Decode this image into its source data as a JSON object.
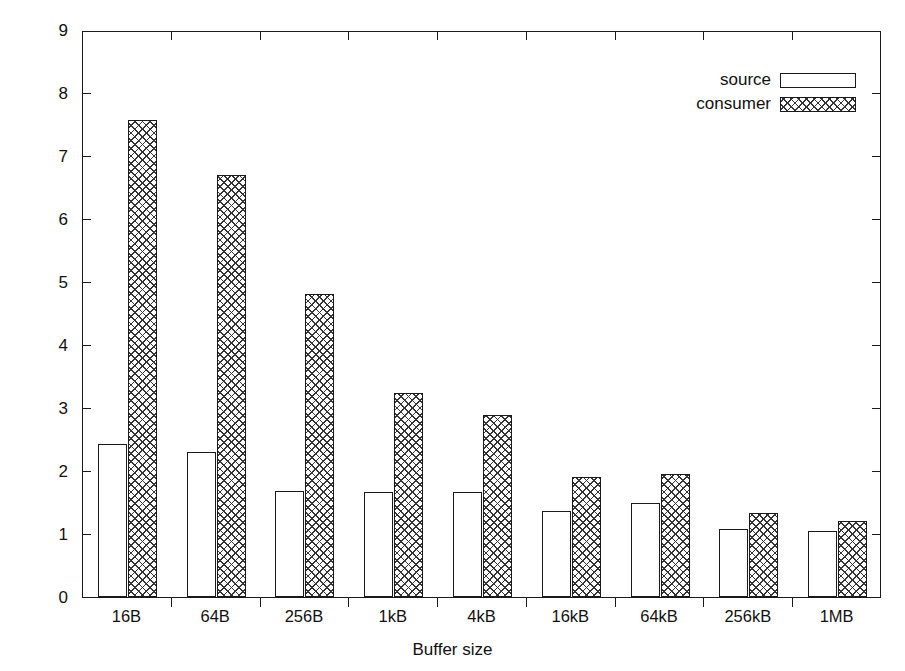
{
  "chart_data": {
    "type": "bar",
    "title": "",
    "xlabel": "Buffer size",
    "ylabel": "ChilFlow/TCP CPU usage ratio",
    "categories": [
      "16B",
      "64B",
      "256B",
      "1kB",
      "4kB",
      "16kB",
      "64kB",
      "256kB",
      "1MB"
    ],
    "series": [
      {
        "name": "source",
        "fill": "empty",
        "values": [
          2.43,
          2.3,
          1.68,
          1.66,
          1.67,
          1.36,
          1.49,
          1.08,
          1.04
        ]
      },
      {
        "name": "consumer",
        "fill": "crosshatch",
        "values": [
          7.57,
          6.7,
          4.81,
          3.24,
          2.89,
          1.9,
          1.96,
          1.34,
          1.21
        ]
      }
    ],
    "ylim": [
      0,
      9
    ],
    "yticks": [
      0,
      1,
      2,
      3,
      4,
      5,
      6,
      7,
      8,
      9
    ],
    "ytick_labels": [
      "0",
      "1",
      "2",
      "3",
      "4",
      "5",
      "6",
      "7",
      "8",
      "9"
    ],
    "grid": false,
    "legend_position": "top-right",
    "colors": {
      "axis": "#1a1a1a",
      "bar_outline": "#1a1a1a",
      "source_fill": "#ffffff",
      "consumer_fill": "#ffffff",
      "hatch": "#333333",
      "background": "#ffffff"
    }
  },
  "legend": {
    "entries": [
      {
        "label": "source"
      },
      {
        "label": "consumer"
      }
    ]
  },
  "axes": {
    "y": {
      "label": "ChilFlow/TCP CPU usage ratio"
    },
    "x": {
      "label": "Buffer size"
    }
  }
}
